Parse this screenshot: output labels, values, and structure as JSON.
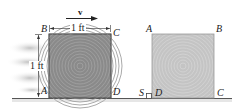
{
  "figure": {
    "colors": {
      "crate_left": "#8a8a8a",
      "crate_right": "#c4c4c4",
      "ground": "#555555",
      "text": "#222222"
    },
    "velocity": {
      "label": "v"
    },
    "dimensions": {
      "width": "1 ft",
      "height": "1 ft"
    },
    "crate_sliding": {
      "corners": {
        "top_left": "B",
        "top_right": "C",
        "bottom_left": "A",
        "bottom_right": "D"
      }
    },
    "crate_tipping": {
      "corners": {
        "top_left": "A",
        "top_right": "B",
        "bottom_left": "D",
        "bottom_right": "C"
      },
      "stop_label": "S"
    }
  }
}
